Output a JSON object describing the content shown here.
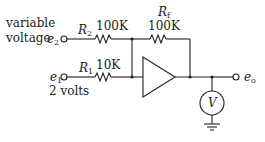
{
  "diagram": {
    "type": "op-amp summing circuit",
    "inputs": {
      "e2": {
        "symbol": "e",
        "sub": "2",
        "description_line1": "variable",
        "description_line2": "voltage"
      },
      "e1": {
        "symbol": "e",
        "sub": "1",
        "description": "2 volts"
      }
    },
    "resistors": {
      "R2": {
        "symbol": "R",
        "sub": "2",
        "value": "100K"
      },
      "R1": {
        "symbol": "R",
        "sub": "1",
        "value": "10K"
      },
      "Rf": {
        "symbol": "R",
        "sub": "f",
        "value": "100K"
      }
    },
    "output": {
      "symbol": "e",
      "sub": "o"
    },
    "meter": {
      "label": "V"
    },
    "colors": {
      "stroke": "#222222",
      "background": "#ffffff"
    }
  }
}
